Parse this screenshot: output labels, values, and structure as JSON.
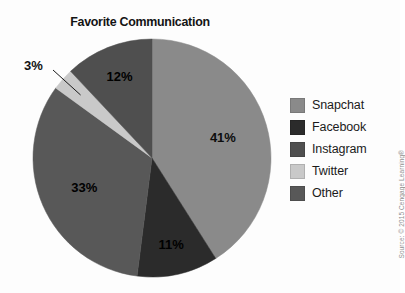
{
  "chart_data": {
    "type": "pie",
    "title": "Favorite Communication",
    "xlabel": "",
    "ylabel": "",
    "legend_position": "right",
    "grid": false,
    "categories": [
      "Snapchat",
      "Facebook",
      "Instagram",
      "Twitter",
      "Other"
    ],
    "values": [
      41,
      11,
      12,
      3,
      33
    ],
    "value_labels": [
      "41%",
      "11%",
      "12%",
      "3%",
      "33%"
    ],
    "colors": [
      "#8a8a8a",
      "#2b2b2b",
      "#4f4f4f",
      "#c9c9c9",
      "#585858"
    ],
    "slices": [
      {
        "label": "Snapchat",
        "value": 41,
        "display": "41%",
        "color": "#8a8a8a",
        "label_placement": "inside"
      },
      {
        "label": "Facebook",
        "value": 11,
        "display": "11%",
        "color": "#2b2b2b",
        "label_placement": "inside"
      },
      {
        "label": "Other",
        "value": 33,
        "display": "33%",
        "color": "#585858",
        "label_placement": "inside"
      },
      {
        "label": "Twitter",
        "value": 3,
        "display": "3%",
        "color": "#c9c9c9",
        "label_placement": "callout"
      },
      {
        "label": "Instagram",
        "value": 12,
        "display": "12%",
        "color": "#4f4f4f",
        "label_placement": "inside"
      }
    ]
  },
  "legend": {
    "items": [
      {
        "label": "Snapchat",
        "color": "#8a8a8a"
      },
      {
        "label": "Facebook",
        "color": "#2b2b2b"
      },
      {
        "label": "Instagram",
        "color": "#4f4f4f"
      },
      {
        "label": "Twitter",
        "color": "#c9c9c9"
      },
      {
        "label": "Other",
        "color": "#585858"
      }
    ]
  },
  "source": {
    "credit": "Source: © 2015 Cengage Learning®"
  }
}
